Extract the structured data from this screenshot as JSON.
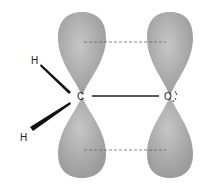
{
  "diagram": {
    "atoms": {
      "h_top": "H",
      "h_bottom": "H",
      "carbon": "C",
      "oxygen": "O"
    },
    "colors": {
      "lobe": "#a8a8a8",
      "lobe_highlight": "#c8c8c8",
      "bond": "#222222",
      "dash": "#555555"
    }
  }
}
